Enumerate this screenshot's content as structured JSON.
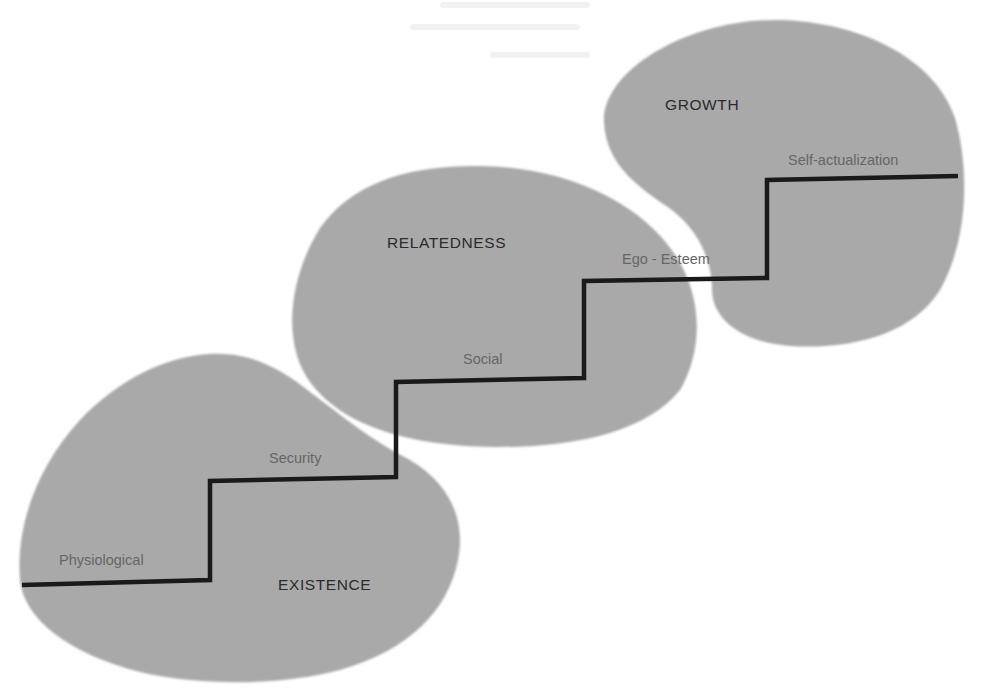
{
  "diagram": {
    "type": "erg-theory-staircase",
    "colors": {
      "background": "#ffffff",
      "blob_fill": "#a9a9a9",
      "staircase_line": "#1a1a1a",
      "group_label_text": "#2b2b2b",
      "step_label_text": "#666666"
    },
    "groups": [
      {
        "id": "existence",
        "label": "EXISTENCE"
      },
      {
        "id": "relatedness",
        "label": "RELATEDNESS"
      },
      {
        "id": "growth",
        "label": "GROWTH"
      }
    ],
    "steps": [
      {
        "level": 1,
        "label": "Physiological",
        "group": "existence"
      },
      {
        "level": 2,
        "label": "Security",
        "group": "existence"
      },
      {
        "level": 3,
        "label": "Social",
        "group": "relatedness"
      },
      {
        "level": 4,
        "label": "Ego - Esteem",
        "group": "relatedness"
      },
      {
        "level": 5,
        "label": "Self-actualization",
        "group": "growth"
      }
    ]
  }
}
